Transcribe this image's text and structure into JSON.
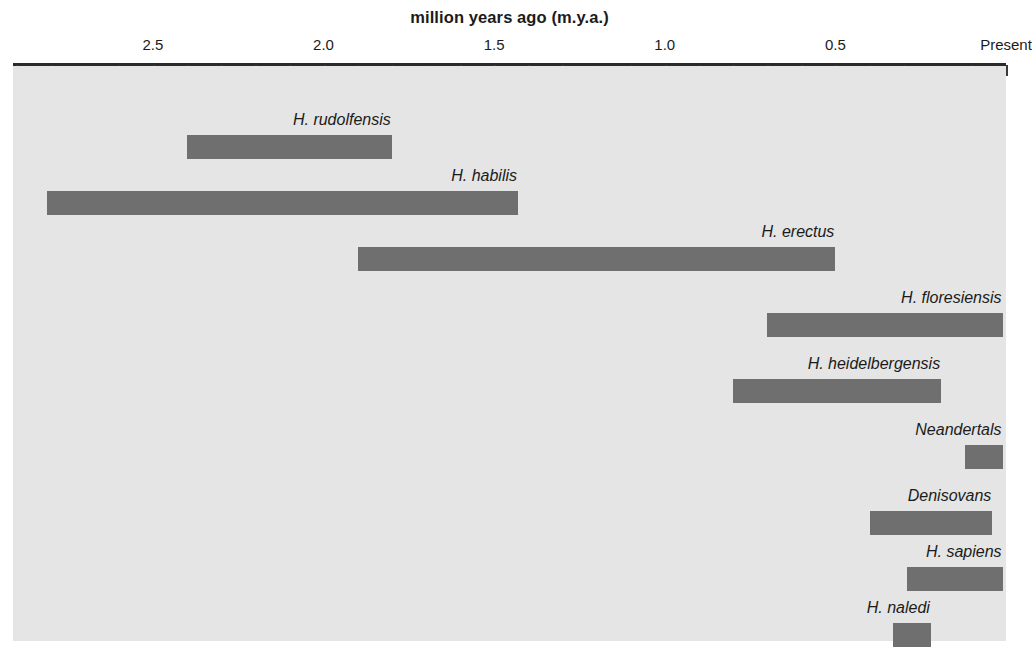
{
  "chart_data": {
    "type": "bar",
    "orientation": "horizontal-range",
    "title": "million years ago (m.y.a.)",
    "xlabel": "million years ago (m.y.a.)",
    "ylabel": "",
    "xlim": [
      2.91,
      0.0
    ],
    "x_axis_direction": "reversed",
    "grid": false,
    "legend": "none",
    "tick_labels": [
      "2.5",
      "2.0",
      "1.5",
      "1.0",
      "0.5",
      "Present"
    ],
    "tick_values": [
      2.5,
      2.0,
      1.5,
      1.0,
      0.5,
      0.0
    ],
    "minor_tick_interval": 0.1,
    "bar_color": "#6e6f6e",
    "plot_background": "#e4e5e4",
    "page_background": "#ffffff",
    "axis_color": "#2b2b2b",
    "text_color": "#1b1b1b",
    "categories": [
      "H. rudolfensis",
      "H. habilis",
      "H. erectus",
      "H. floresiensis",
      "H. heidelbergensis",
      "Neandertals",
      "Denisovans",
      "H. sapiens",
      "H. naledi"
    ],
    "ranges": [
      {
        "name": "H. rudolfensis",
        "start_mya": 2.4,
        "end_mya": 1.8
      },
      {
        "name": "H. habilis",
        "start_mya": 2.81,
        "end_mya": 1.43
      },
      {
        "name": "H. erectus",
        "start_mya": 1.9,
        "end_mya": 0.5
      },
      {
        "name": "H. floresiensis",
        "start_mya": 0.7,
        "end_mya": 0.01
      },
      {
        "name": "H. heidelbergensis",
        "start_mya": 0.8,
        "end_mya": 0.19
      },
      {
        "name": "Neandertals",
        "start_mya": 0.12,
        "end_mya": 0.01
      },
      {
        "name": "Denisovans",
        "start_mya": 0.4,
        "end_mya": 0.04
      },
      {
        "name": "H. sapiens",
        "start_mya": 0.29,
        "end_mya": 0.01
      },
      {
        "name": "H. naledi",
        "start_mya": 0.33,
        "end_mya": 0.22
      }
    ]
  },
  "layout": {
    "plot_left_px": 13,
    "plot_right_px": 1006,
    "row_tops_px": [
      45,
      101,
      157,
      223,
      289,
      355,
      421,
      477,
      533
    ]
  }
}
